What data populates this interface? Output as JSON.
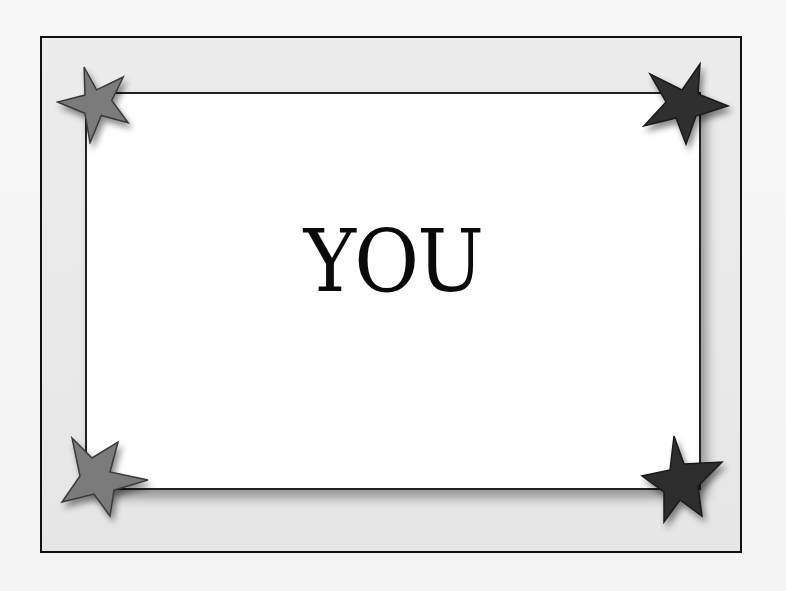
{
  "card": {
    "text": "YOU"
  },
  "colors": {
    "background": "#f5f5f5",
    "frame_fill": "#e8e8e8",
    "frame_border": "#111111",
    "card_fill": "#ffffff",
    "text": "#0a0a0a",
    "star_light": "#7a7a7a",
    "star_dark": "#2e2e2e"
  },
  "decorations": {
    "stars": [
      {
        "position": "top-left",
        "shade": "light"
      },
      {
        "position": "top-right",
        "shade": "dark"
      },
      {
        "position": "bottom-left",
        "shade": "light"
      },
      {
        "position": "bottom-right",
        "shade": "dark"
      }
    ]
  }
}
